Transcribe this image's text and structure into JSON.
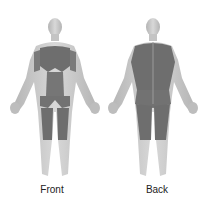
{
  "figures": [
    {
      "id": "front",
      "label": "Front"
    },
    {
      "id": "back",
      "label": "Back"
    }
  ],
  "colors": {
    "skin": "#c9c9c9",
    "skin_shadow": "#a8a8a8",
    "muscle": "#6e6e6e",
    "background": "#ffffff",
    "label": "#222222"
  }
}
